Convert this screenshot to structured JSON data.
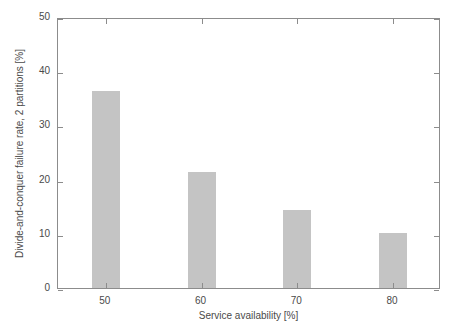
{
  "chart_data": {
    "type": "bar",
    "title": "",
    "xlabel": "Service availability [%]",
    "ylabel": "Divide-and-conquer failure rate, 2 partitions [%]",
    "categories": [
      "50",
      "60",
      "70",
      "80"
    ],
    "values": [
      36.3,
      21.4,
      14.4,
      10.1
    ],
    "xlim": [
      45,
      85
    ],
    "ylim": [
      0,
      50
    ],
    "xticks": [
      "50",
      "60",
      "70",
      "80"
    ],
    "yticks": [
      "0",
      "10",
      "20",
      "30",
      "40",
      "50"
    ],
    "grid": false,
    "legend": null,
    "bar_color": "#c4c4c4",
    "axis_color": "#8c8c8c",
    "background": "#ffffff"
  }
}
